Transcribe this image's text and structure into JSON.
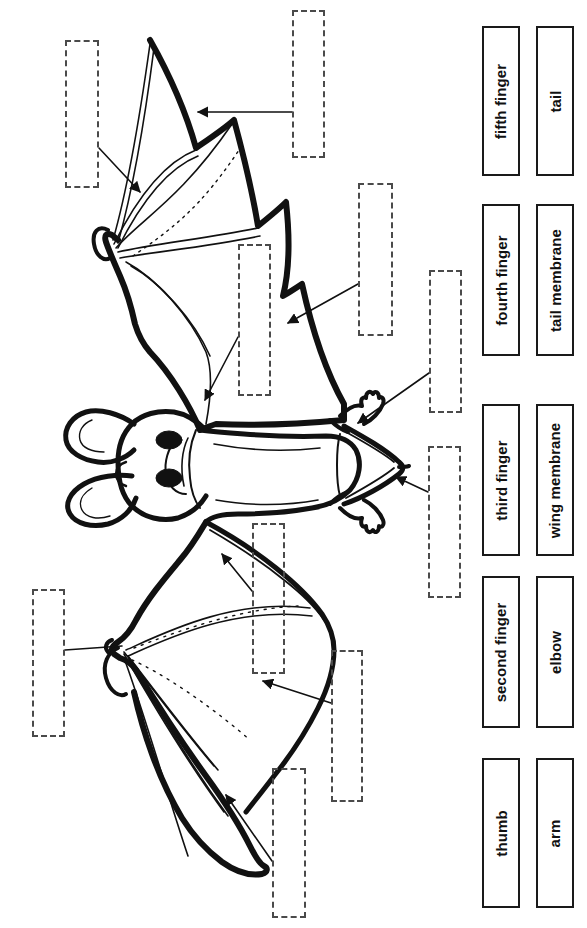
{
  "worksheet": {
    "title": "Bat Anatomy Labeling Worksheet",
    "subject": "bat",
    "colors": {
      "ink": "#1a1a1a",
      "dashed_box_border": "#4a4a4a",
      "page_background": "#ffffff"
    }
  },
  "word_bank": {
    "columns": 2,
    "items": [
      {
        "id": "fifth-finger",
        "label": "fifth finger",
        "column": "left",
        "row": 1
      },
      {
        "id": "fourth-finger",
        "label": "fourth finger",
        "column": "left",
        "row": 2
      },
      {
        "id": "third-finger",
        "label": "third finger",
        "column": "left",
        "row": 3
      },
      {
        "id": "second-finger",
        "label": "second finger",
        "column": "left",
        "row": 4
      },
      {
        "id": "thumb",
        "label": "thumb",
        "column": "left",
        "row": 5
      },
      {
        "id": "tail",
        "label": "tail",
        "column": "right",
        "row": 1
      },
      {
        "id": "tail-membrane",
        "label": "tail membrane",
        "column": "right",
        "row": 2
      },
      {
        "id": "wing-membrane",
        "label": "wing membrane",
        "column": "right",
        "row": 3
      },
      {
        "id": "elbow",
        "label": "elbow",
        "column": "right",
        "row": 4
      },
      {
        "id": "arm",
        "label": "arm",
        "column": "right",
        "row": 5
      }
    ]
  },
  "answer_boxes": [
    {
      "id": "answer-box-1",
      "value": "",
      "x": 65,
      "y": 40,
      "w": 34,
      "h": 148
    },
    {
      "id": "answer-box-2",
      "value": "",
      "x": 292,
      "y": 10,
      "w": 33,
      "h": 148
    },
    {
      "id": "answer-box-3",
      "value": "",
      "x": 358,
      "y": 183,
      "w": 35,
      "h": 153
    },
    {
      "id": "answer-box-4",
      "value": "",
      "x": 238,
      "y": 244,
      "w": 33,
      "h": 152
    },
    {
      "id": "answer-box-5",
      "value": "",
      "x": 429,
      "y": 270,
      "w": 33,
      "h": 143
    },
    {
      "id": "answer-box-6",
      "value": "",
      "x": 428,
      "y": 446,
      "w": 33,
      "h": 152
    },
    {
      "id": "answer-box-7",
      "value": "",
      "x": 252,
      "y": 523,
      "w": 33,
      "h": 151
    },
    {
      "id": "answer-box-8",
      "value": "",
      "x": 32,
      "y": 589,
      "w": 33,
      "h": 148
    },
    {
      "id": "answer-box-9",
      "value": "",
      "x": 331,
      "y": 650,
      "w": 32,
      "h": 152
    },
    {
      "id": "answer-box-10",
      "value": "",
      "x": 272,
      "y": 768,
      "w": 34,
      "h": 150
    }
  ],
  "leader_lines": [
    {
      "id": "leader-1",
      "from_box": "answer-box-1",
      "points": "99,148 138,190",
      "arrow": true,
      "target": "fifth finger"
    },
    {
      "id": "leader-2",
      "from_box": "answer-box-2",
      "points": "292,112 196,112",
      "arrow": true,
      "target": "fourth finger"
    },
    {
      "id": "leader-3",
      "from_box": "answer-box-3",
      "points": "358,284 286,321",
      "arrow": true,
      "target": "wing membrane"
    },
    {
      "id": "leader-4",
      "from_box": "answer-box-4",
      "points": "238,337 203,402",
      "arrow": true,
      "target": "third finger"
    },
    {
      "id": "leader-5",
      "from_box": "answer-box-5",
      "points": "429,373 356,421",
      "arrow": true,
      "target": "tail"
    },
    {
      "id": "leader-6",
      "from_box": "answer-box-6",
      "points": "428,489 396,476",
      "arrow": true,
      "target": "tail membrane"
    },
    {
      "id": "leader-7",
      "from_box": "answer-box-7",
      "points": "252,591 224,556",
      "arrow": true,
      "target": "arm"
    },
    {
      "id": "leader-8",
      "from_box": "answer-box-8",
      "points": "65,650 120,646",
      "arrow": false,
      "target": "elbow"
    },
    {
      "id": "leader-9",
      "from_box": "answer-box-9",
      "points": "331,703 261,683",
      "arrow": true,
      "target": "second finger"
    },
    {
      "id": "leader-10",
      "from_box": "answer-box-10",
      "points": "272,861 224,797",
      "arrow": true,
      "target": "thumb"
    }
  ]
}
